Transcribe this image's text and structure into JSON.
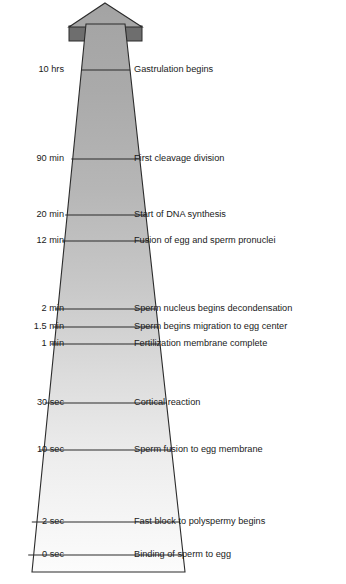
{
  "figure": {
    "orientation": "vertical-arrow-upward",
    "colors": {
      "arrow_top_fill": "#a9a9a9",
      "arrow_bottom_fill": "#fbfbfb",
      "arrow_wing_fill": "#6e6e6e",
      "outline": "#2b2b2b",
      "tick_line": "#2b2b2b",
      "text": "#1a1a1a",
      "background": "#ffffff"
    },
    "geometry": {
      "tip_x": 105,
      "tip_y": 3,
      "wing_left_x": 69,
      "wing_right_x": 141,
      "wing_bottom_y": 41,
      "shaft_top_left_x": 86,
      "shaft_top_right_x": 125,
      "shaft_top_y": 24,
      "base_left_x": 32,
      "base_right_x": 185,
      "base_y": 572
    }
  },
  "chart_data": {
    "type": "table",
    "xlabel": "",
    "ylabel": "Time since sperm binding",
    "axis_direction": "time increases upward",
    "columns": [
      "time",
      "event"
    ],
    "events": [
      {
        "time": "10 hrs",
        "event": "Gastrulation begins",
        "y": 70
      },
      {
        "time": "90 min",
        "event": "First cleavage division",
        "y": 159
      },
      {
        "time": "20 min",
        "event": "Start of DNA synthesis",
        "y": 215
      },
      {
        "time": "12 min",
        "event": "Fusion of egg and sperm pronuclei",
        "y": 241
      },
      {
        "time": "2 min",
        "event": "Sperm nucleus begins decondensation",
        "y": 309
      },
      {
        "time": "1.5 min",
        "event": "Sperm begins migration to egg center",
        "y": 327
      },
      {
        "time": "1 min",
        "event": "Fertilization membrane complete",
        "y": 344
      },
      {
        "time": "30 sec",
        "event": "Cortical reaction",
        "y": 403
      },
      {
        "time": "10 sec",
        "event": "Sperm fusion to egg membrane",
        "y": 450
      },
      {
        "time": "2 sec",
        "event": "Fast block to polyspermy begins",
        "y": 522
      },
      {
        "time": "0 sec",
        "event": "Binding of sperm to egg",
        "y": 555
      }
    ]
  }
}
